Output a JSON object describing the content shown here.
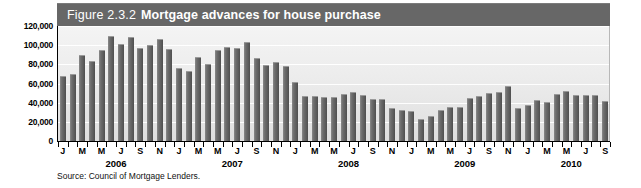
{
  "figure": {
    "number": "Figure 2.3.2",
    "title": "Mortgage advances for house purchase",
    "source": "Source: Council of Mortgage Lenders."
  },
  "chart_data": {
    "type": "bar",
    "title": "Mortgage advances for house purchase",
    "xlabel": "",
    "ylabel": "",
    "ylim": [
      0,
      120000
    ],
    "yticks": [
      0,
      20000,
      40000,
      60000,
      80000,
      100000,
      120000
    ],
    "ytick_labels": [
      "0",
      "20,000",
      "40,000",
      "60,000",
      "80,000",
      "100,000",
      "120,000"
    ],
    "grid": true,
    "legend": false,
    "bar_color": "#5d5d5d",
    "plot_bg": "#ececec",
    "title_bar_color": "#676767",
    "categories": [
      "J 2006",
      "F 2006",
      "M 2006",
      "A 2006",
      "M 2006",
      "J 2006",
      "J 2006",
      "A 2006",
      "S 2006",
      "O 2006",
      "N 2006",
      "D 2006",
      "J 2007",
      "F 2007",
      "M 2007",
      "A 2007",
      "M 2007",
      "J 2007",
      "J 2007",
      "A 2007",
      "S 2007",
      "O 2007",
      "N 2007",
      "D 2007",
      "J 2008",
      "F 2008",
      "M 2008",
      "A 2008",
      "M 2008",
      "J 2008",
      "J 2008",
      "A 2008",
      "S 2008",
      "O 2008",
      "N 2008",
      "D 2008",
      "J 2009",
      "F 2009",
      "M 2009",
      "A 2009",
      "M 2009",
      "J 2009",
      "J 2009",
      "A 2009",
      "S 2009",
      "O 2009",
      "N 2009",
      "D 2009",
      "J 2010",
      "F 2010",
      "M 2010",
      "A 2010",
      "M 2010",
      "J 2010",
      "J 2010",
      "A 2010",
      "S 2010"
    ],
    "values": [
      68000,
      70000,
      90000,
      83000,
      95000,
      110000,
      101000,
      109000,
      97000,
      100000,
      106000,
      96000,
      76000,
      73000,
      88000,
      80000,
      95000,
      98000,
      97000,
      103000,
      87000,
      79000,
      82000,
      78000,
      62000,
      47000,
      47000,
      46000,
      46000,
      49000,
      51000,
      48000,
      44000,
      44000,
      34000,
      32000,
      31000,
      23000,
      26000,
      32000,
      36000,
      35000,
      45000,
      47000,
      50000,
      51000,
      57000,
      34000,
      38000,
      43000,
      41000,
      49000,
      52000,
      48000,
      48000,
      48000,
      42000
    ],
    "month_ticks": [
      {
        "index": 0,
        "label": "J"
      },
      {
        "index": 2,
        "label": "M"
      },
      {
        "index": 4,
        "label": "M"
      },
      {
        "index": 6,
        "label": "J"
      },
      {
        "index": 8,
        "label": "S"
      },
      {
        "index": 10,
        "label": "N"
      },
      {
        "index": 12,
        "label": "J"
      },
      {
        "index": 14,
        "label": "M"
      },
      {
        "index": 16,
        "label": "M"
      },
      {
        "index": 18,
        "label": "J"
      },
      {
        "index": 20,
        "label": "S"
      },
      {
        "index": 22,
        "label": "N"
      },
      {
        "index": 24,
        "label": "J"
      },
      {
        "index": 26,
        "label": "M"
      },
      {
        "index": 28,
        "label": "M"
      },
      {
        "index": 30,
        "label": "J"
      },
      {
        "index": 32,
        "label": "S"
      },
      {
        "index": 34,
        "label": "N"
      },
      {
        "index": 36,
        "label": "J"
      },
      {
        "index": 38,
        "label": "M"
      },
      {
        "index": 40,
        "label": "M"
      },
      {
        "index": 42,
        "label": "J"
      },
      {
        "index": 44,
        "label": "S"
      },
      {
        "index": 46,
        "label": "N"
      },
      {
        "index": 48,
        "label": "J"
      },
      {
        "index": 50,
        "label": "M"
      },
      {
        "index": 52,
        "label": "M"
      },
      {
        "index": 54,
        "label": "J"
      },
      {
        "index": 56,
        "label": "S"
      }
    ],
    "year_labels": [
      {
        "label": "2006",
        "center_index": 5.5
      },
      {
        "label": "2007",
        "center_index": 17.5
      },
      {
        "label": "2008",
        "center_index": 29.5
      },
      {
        "label": "2009",
        "center_index": 41.5
      },
      {
        "label": "2010",
        "center_index": 52.5
      }
    ]
  }
}
